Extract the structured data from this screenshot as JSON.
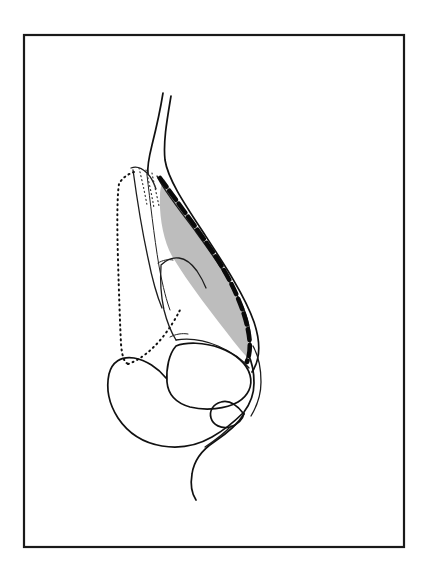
{
  "figure": {
    "domain": "anatomical-line-drawing",
    "title": "Lateral profile view of nose showing cartilage framework with shaded resection area",
    "canvas": {
      "width": 429,
      "height": 572,
      "background": "#ffffff"
    },
    "frame": {
      "name": "figure-border",
      "x": 24,
      "y": 35,
      "width": 380,
      "height": 512,
      "stroke": "#1a1a1a",
      "stroke_width": 2.2,
      "fill": "#ffffff"
    },
    "palette": {
      "ink": "#111111",
      "ink_light": "#2a2a2a",
      "shade_gray": "#bdbdbd",
      "shade_gray_dark": "#a9a9a9",
      "paper": "#ffffff"
    },
    "line_styles": {
      "solid_contour": {
        "stroke": "#111111",
        "stroke_width": 1.7,
        "dash": "none"
      },
      "thin_contour": {
        "stroke": "#1c1c1c",
        "stroke_width": 1.3,
        "dash": "none"
      },
      "hair_contour": {
        "stroke": "#222222",
        "stroke_width": 1.0,
        "dash": "none"
      },
      "dotted_outline": {
        "stroke": "#111111",
        "stroke_width": 2.0,
        "dash": "1 4"
      },
      "fine_dotted": {
        "stroke": "#333333",
        "stroke_width": 1.2,
        "dash": "1 3"
      },
      "heavy_dashed_incision": {
        "stroke": "#0a0a0a",
        "stroke_width": 4.6,
        "dash": "11 5"
      }
    },
    "elements": [
      {
        "name": "forehead-glabella-contour",
        "label": "Forehead / glabella skin contour",
        "style": "solid_contour",
        "path": "M 163 93 C 160 112, 156 129, 152 145 C 149 157, 147 166, 148 174"
      },
      {
        "name": "nasal-dorsum-skin-contour",
        "label": "Nasal dorsum outer skin line",
        "style": "solid_contour",
        "path": "M 171 96 C 167 120, 163 142, 165 160 C 168 180, 186 206, 205 235 C 224 264, 245 296, 254 322 C 261 343, 260 360, 252 372"
      },
      {
        "name": "nasal-dorsum-inner-contour",
        "label": "Inner dorsum line (subcutaneous plane)",
        "style": "thin_contour",
        "path": "M 157 176 C 162 188, 178 208, 196 232 C 215 258, 236 288, 245 312 C 252 331, 252 348, 245 362"
      },
      {
        "name": "nasal-bone-dorsal-edge",
        "label": "Resected nasal bone dorsal edge",
        "style": "thin_contour",
        "path": "M 131 168 C 136 166, 142 168, 147 173 C 151 177, 154 183, 156 189"
      },
      {
        "name": "nasal-bone-anterior-wall",
        "label": "Nasal bone anterior wall",
        "style": "thin_contour",
        "path": "M 133 170 C 136 192, 141 226, 148 258 C 152 278, 157 296, 162 308"
      },
      {
        "name": "nasal-bone-lateral-wall",
        "label": "Nasal bone lateral wall",
        "style": "hair_contour",
        "path": "M 147 175 C 150 200, 154 236, 159 266 C 163 288, 167 302, 170 310"
      },
      {
        "name": "original-profile-dotted-outline",
        "label": "Original (pre-operative) profile shown dotted",
        "style": "dotted_outline",
        "path": "M 134 172 C 128 174, 122 178, 119 184 C 117 196, 117 226, 118 260 C 119 294, 120 324, 121 344 C 122 356, 124 362, 128 364"
      },
      {
        "name": "original-profile-dotted-lower",
        "label": "Dotted outline continuing to nasal base",
        "style": "dotted_outline",
        "path": "M 128 364 C 140 360, 152 350, 162 338 C 170 328, 176 318, 180 310"
      },
      {
        "name": "fine-dotted-bone-hatch-a",
        "label": "Fine dotted bone marking",
        "style": "fine_dotted",
        "path": "M 139 168 C 142 180, 145 194, 147 205"
      },
      {
        "name": "fine-dotted-bone-hatch-b",
        "label": "Fine dotted bone marking",
        "style": "fine_dotted",
        "path": "M 146 170 C 149 182, 152 196, 154 208"
      },
      {
        "name": "fine-dotted-bone-hatch-c",
        "label": "Fine dotted bone marking",
        "style": "fine_dotted",
        "path": "M 152 173 C 154 184, 157 196, 159 206"
      },
      {
        "name": "upper-lateral-cartilage-outline",
        "label": "Upper lateral cartilage",
        "style": "thin_contour",
        "path": "M 161 265 C 166 260, 172 257, 179 258 C 186 259, 192 264, 197 271 C 201 277, 204 283, 206 288"
      },
      {
        "name": "upper-lateral-cartilage-lower",
        "label": "Upper lateral cartilage inferior border",
        "style": "thin_contour",
        "path": "M 161 266 C 160 280, 161 296, 164 310 C 167 322, 171 332, 176 340"
      },
      {
        "name": "septal-cartilage-border",
        "label": "Septal cartilage border",
        "style": "thin_contour",
        "path": "M 176 340 C 188 338, 204 340, 218 346 C 232 352, 243 360, 249 368"
      },
      {
        "name": "lower-lateral-cartilage-dome",
        "label": "Lower lateral (alar) cartilage dome",
        "style": "solid_contour",
        "path": "M 176 346 C 186 342, 204 342, 220 348 C 236 354, 247 364, 250 375 C 253 386, 248 396, 238 402 C 226 409, 206 411, 190 407 C 176 403, 168 394, 167 382 C 166 368, 169 354, 176 346 Z"
      },
      {
        "name": "alar-base-contour",
        "label": "Ala / nostril sidewall contour",
        "style": "solid_contour",
        "path": "M 166 378 C 158 368, 146 360, 134 358 C 121 356, 112 362, 109 374 C 106 388, 109 404, 118 418 C 128 433, 144 443, 162 446 C 180 449, 198 445, 212 437 C 226 429, 236 420, 243 413"
      },
      {
        "name": "nostril-rim-inner",
        "label": "Nostril rim inner curve",
        "style": "solid_contour",
        "path": "M 243 413 C 236 404, 228 400, 221 402 C 213 404, 209 411, 211 418 C 213 425, 221 429, 230 427 C 238 425, 243 419, 244 413"
      },
      {
        "name": "columella-contour",
        "label": "Columella outer contour",
        "style": "solid_contour",
        "path": "M 244 412 C 250 404, 254 394, 254 383 C 254 372, 252 362, 248 354"
      },
      {
        "name": "columella-inner-contour",
        "label": "Columella inner contour",
        "style": "thin_contour",
        "path": "M 251 416 C 257 406, 261 394, 261 382 C 261 368, 258 355, 253 346"
      },
      {
        "name": "upper-lip-contour",
        "label": "Upper lip profile",
        "style": "solid_contour",
        "path": "M 244 414 C 238 424, 226 434, 214 442 C 202 450, 194 460, 192 474 C 190 486, 192 494, 196 500"
      },
      {
        "name": "nasolabial-inner-contour",
        "label": "Nasal sill / nasolabial inner line",
        "style": "thin_contour",
        "path": "M 231 426 C 224 434, 214 441, 205 447"
      },
      {
        "name": "shaded-resection-area",
        "label": "Shaded area indicating tissue to be resected",
        "style": "shade",
        "fill": "#bdbdbd",
        "stroke": "none",
        "path": "M 164 179 C 175 196, 191 219, 206 242 C 221 265, 236 290, 244 310 C 251 327, 252 344, 247 357 C 240 350, 228 334, 214 316 C 198 295, 182 273, 172 256 C 163 240, 159 215, 160 196 C 160 188, 162 182, 164 179 Z"
      },
      {
        "name": "incision-dashed-line",
        "label": "Heavy dashed line marking planned osteotomy / incision",
        "style": "heavy_dashed_incision",
        "path": "M 160 178 C 176 200, 196 227, 214 254 C 232 281, 244 309, 248 330 C 251 344, 250 354, 247 362"
      },
      {
        "name": "cartilage-junction-mark-upper",
        "label": "Keystone junction tick",
        "style": "hair_contour",
        "path": "M 158 263 C 163 260, 168 259, 173 260"
      },
      {
        "name": "cartilage-junction-mark-lower",
        "label": "Septal junction tick",
        "style": "hair_contour",
        "path": "M 170 337 C 176 334, 182 333, 188 334"
      }
    ]
  }
}
